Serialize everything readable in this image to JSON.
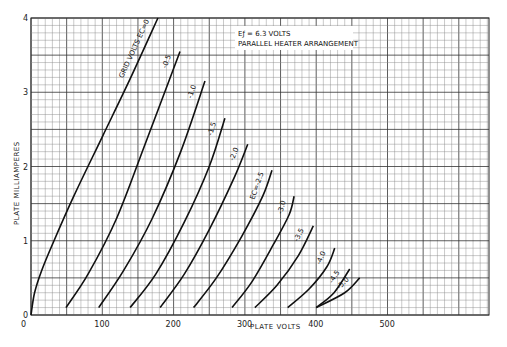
{
  "chart_data": {
    "type": "line",
    "title": "",
    "annotation_box": [
      "Eƒ = 6.3 VOLTS",
      "PARALLEL HEATER ARRANGEMENT"
    ],
    "xlabel": "PLATE VOLTS",
    "ylabel": "PLATE MILLIAMPERES",
    "xlim": [
      0,
      640
    ],
    "ylim": [
      0,
      4
    ],
    "x_ticks": [
      0,
      100,
      200,
      300,
      400,
      500
    ],
    "y_ticks": [
      0,
      1,
      2,
      3,
      4
    ],
    "grid": true,
    "legend": "inline curve labels",
    "series": [
      {
        "name": "GRID VOLTS Ec=0",
        "label": "GRID VOLTS EC=0",
        "points": [
          [
            0,
            0
          ],
          [
            5,
            0.3
          ],
          [
            15,
            0.6
          ],
          [
            30,
            0.95
          ],
          [
            60,
            1.6
          ],
          [
            100,
            2.4
          ],
          [
            140,
            3.2
          ],
          [
            178,
            4.0
          ]
        ]
      },
      {
        "name": "-0.5",
        "label": "-0.5",
        "points": [
          [
            49,
            0.1
          ],
          [
            80,
            0.55
          ],
          [
            120,
            1.3
          ],
          [
            160,
            2.3
          ],
          [
            209,
            3.55
          ]
        ]
      },
      {
        "name": "-1.0",
        "label": "-1.0",
        "points": [
          [
            95,
            0.1
          ],
          [
            130,
            0.6
          ],
          [
            170,
            1.3
          ],
          [
            210,
            2.2
          ],
          [
            244,
            3.15
          ]
        ]
      },
      {
        "name": "-1.5",
        "label": "-1.5",
        "points": [
          [
            139,
            0.1
          ],
          [
            175,
            0.55
          ],
          [
            215,
            1.25
          ],
          [
            250,
            2.0
          ],
          [
            272,
            2.65
          ]
        ]
      },
      {
        "name": "-2.0",
        "label": "-2.0",
        "points": [
          [
            181,
            0.1
          ],
          [
            215,
            0.55
          ],
          [
            250,
            1.15
          ],
          [
            285,
            1.85
          ],
          [
            304,
            2.3
          ]
        ]
      },
      {
        "name": "-2.5",
        "label": "EC=-2.5",
        "points": [
          [
            228,
            0.1
          ],
          [
            260,
            0.5
          ],
          [
            295,
            1.05
          ],
          [
            325,
            1.6
          ],
          [
            338,
            1.95
          ]
        ]
      },
      {
        "name": "-3.0",
        "label": "-3.0",
        "points": [
          [
            282,
            0.1
          ],
          [
            310,
            0.45
          ],
          [
            340,
            0.95
          ],
          [
            362,
            1.35
          ],
          [
            369,
            1.6
          ]
        ]
      },
      {
        "name": "-3.5",
        "label": "-3.5",
        "points": [
          [
            314,
            0.1
          ],
          [
            345,
            0.4
          ],
          [
            375,
            0.8
          ],
          [
            396,
            1.2
          ]
        ]
      },
      {
        "name": "-4.0",
        "label": "-4.0",
        "points": [
          [
            360,
            0.1
          ],
          [
            390,
            0.35
          ],
          [
            415,
            0.65
          ],
          [
            426,
            0.9
          ]
        ]
      },
      {
        "name": "-4.5",
        "label": "-4.5",
        "points": [
          [
            400,
            0.1
          ],
          [
            425,
            0.3
          ],
          [
            447,
            0.62
          ]
        ]
      },
      {
        "name": "-5.0",
        "label": "-5.0",
        "points": [
          [
            400,
            0.1
          ],
          [
            440,
            0.3
          ],
          [
            461,
            0.5
          ]
        ]
      }
    ]
  },
  "labels": {
    "x_axis": "PLATE VOLTS",
    "y_axis": "PLATE MILLIAMPERES",
    "box_line1": "Eƒ = 6.3 VOLTS",
    "box_line2": "PARALLEL HEATER ARRANGEMENT",
    "x_ticks": [
      "0",
      "100",
      "200",
      "300",
      "400",
      "500"
    ],
    "y_ticks": [
      "0",
      "1",
      "2",
      "3",
      "4"
    ],
    "curve_labels": [
      "GRID VOLTS EC=0",
      "-0.5",
      "-1.0",
      "-1.5",
      "-2.0",
      "EC=-2.5",
      "-3.0",
      "-3.5",
      "-4.0",
      "-4.5",
      "-5.0"
    ]
  }
}
